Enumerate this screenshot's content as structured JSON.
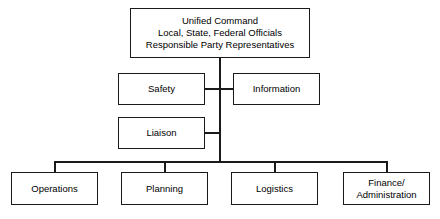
{
  "diagram": {
    "background_color": "#ffffff",
    "line_color": "#1a1a1a",
    "text_color": "#000000",
    "nodes": {
      "unified_command": {
        "label": "Unified Command\nLocal, State, Federal Officials\nResponsible Party Representatives",
        "line1": "Unified Command",
        "line2": "Local, State, Federal Officials",
        "line3": "Responsible Party Representatives"
      },
      "safety": {
        "label": "Safety"
      },
      "information": {
        "label": "Information"
      },
      "liaison": {
        "label": "Liaison"
      },
      "operations": {
        "label": "Operations"
      },
      "planning": {
        "label": "Planning"
      },
      "logistics": {
        "label": "Logistics"
      },
      "finance_administration": {
        "label": "Finance/\nAdministration",
        "line1": "Finance/",
        "line2": "Administration"
      }
    }
  }
}
